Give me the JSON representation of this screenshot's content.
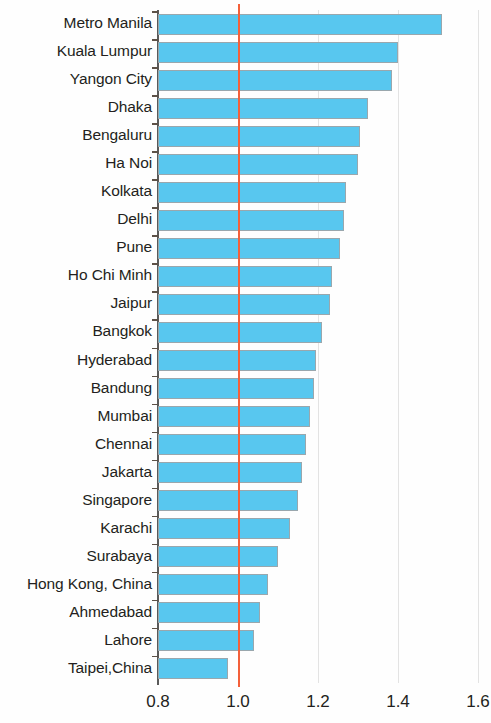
{
  "chart_data": {
    "type": "bar",
    "orientation": "horizontal",
    "title": "",
    "subtitle": "",
    "xlabel": "",
    "ylabel": "",
    "xlim": [
      0.8,
      1.6
    ],
    "xticks": [
      "0.8",
      "1.0",
      "1.2",
      "1.4",
      "1.6"
    ],
    "xtick_values": [
      0.8,
      1.0,
      1.2,
      1.4,
      1.6
    ],
    "grid": true,
    "grid_axis": "x",
    "legend": "none",
    "reference_line": {
      "value": 1.0,
      "color": "#f4603a",
      "label": ""
    },
    "bar_color": "#58c7ef",
    "bar_edge_color": "#9aa7ad",
    "categories": [
      "Metro Manila",
      "Kuala Lumpur",
      "Yangon City",
      "Dhaka",
      "Bengaluru",
      "Ha Noi",
      "Kolkata",
      "Delhi",
      "Pune",
      "Ho Chi Minh",
      "Jaipur",
      "Bangkok",
      "Hyderabad",
      "Bandung",
      "Mumbai",
      "Chennai",
      "Jakarta",
      "Singapore",
      "Karachi",
      "Surabaya",
      "Hong Kong, China",
      "Ahmedabad",
      "Lahore",
      "Taipei,China"
    ],
    "values": [
      1.51,
      1.4,
      1.385,
      1.325,
      1.305,
      1.3,
      1.27,
      1.265,
      1.255,
      1.235,
      1.23,
      1.21,
      1.195,
      1.19,
      1.18,
      1.17,
      1.16,
      1.15,
      1.13,
      1.1,
      1.075,
      1.055,
      1.04,
      0.975
    ]
  }
}
